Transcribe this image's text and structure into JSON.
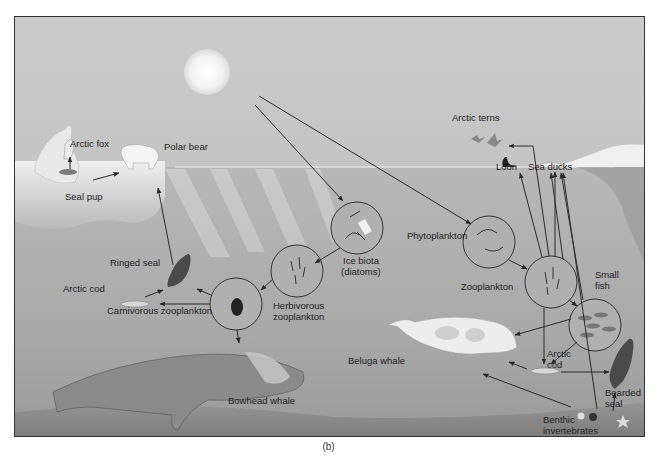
{
  "figure": {
    "caption": "(b)"
  },
  "labels": {
    "arctic_fox": "Arctic fox",
    "polar_bear": "Polar bear",
    "seal_pup": "Seal pup",
    "ringed_seal": "Ringed seal",
    "arctic_cod_left": "Arctic cod",
    "carnivorous_zooplankton": "Carnivorous zooplankton",
    "herbivorous_zooplankton_1": "Herbivorous",
    "herbivorous_zooplankton_2": "zooplankton",
    "ice_biota_1": "Ice biota",
    "ice_biota_2": "(diatoms)",
    "phytoplankton": "Phytoplankton",
    "zooplankton": "Zooplankton",
    "small_fish_1": "Small",
    "small_fish_2": "fish",
    "arctic_terns": "Arctic terns",
    "loon": "Loon",
    "sea_ducks": "Sea ducks",
    "beluga_whale": "Beluga whale",
    "arctic_cod_right_1": "Arctic",
    "arctic_cod_right_2": "cod",
    "bearded_seal_1": "Bearded",
    "bearded_seal_2": "seal",
    "benthic_1": "Benthic",
    "benthic_2": "invertebrates",
    "bowhead_whale": "Bowhead whale"
  },
  "food_web_links": [
    {
      "from": "Sun",
      "to": "Ice biota (diatoms)"
    },
    {
      "from": "Sun",
      "to": "Phytoplankton"
    },
    {
      "from": "Ice biota (diatoms)",
      "to": "Herbivorous zooplankton"
    },
    {
      "from": "Herbivorous zooplankton",
      "to": "Carnivorous zooplankton"
    },
    {
      "from": "Carnivorous zooplankton",
      "to": "Ringed seal"
    },
    {
      "from": "Carnivorous zooplankton",
      "to": "Arctic cod"
    },
    {
      "from": "Carnivorous zooplankton",
      "to": "Bowhead whale"
    },
    {
      "from": "Arctic cod",
      "to": "Ringed seal"
    },
    {
      "from": "Ringed seal",
      "to": "Polar bear"
    },
    {
      "from": "Seal pup",
      "to": "Arctic fox"
    },
    {
      "from": "Seal pup",
      "to": "Polar bear"
    },
    {
      "from": "Phytoplankton",
      "to": "Zooplankton"
    },
    {
      "from": "Zooplankton",
      "to": "Small fish"
    },
    {
      "from": "Zooplankton",
      "to": "Arctic cod"
    },
    {
      "from": "Zooplankton",
      "to": "Arctic terns"
    },
    {
      "from": "Zooplankton",
      "to": "Loon"
    },
    {
      "from": "Zooplankton",
      "to": "Sea ducks"
    },
    {
      "from": "Small fish",
      "to": "Sea ducks"
    },
    {
      "from": "Small fish",
      "to": "Beluga whale"
    },
    {
      "from": "Small fish",
      "to": "Arctic cod"
    },
    {
      "from": "Arctic cod",
      "to": "Beluga whale"
    },
    {
      "from": "Arctic cod",
      "to": "Bearded seal"
    },
    {
      "from": "Benthic invertebrates",
      "to": "Beluga whale"
    },
    {
      "from": "Benthic invertebrates",
      "to": "Bearded seal"
    },
    {
      "from": "Benthic invertebrates",
      "to": "Sea ducks"
    }
  ],
  "colors": {
    "sky": "#c9c9c9",
    "water": "#a8a8a8",
    "ice": "#e4e4e4",
    "seafloor": "#8a8a8a",
    "arrow": "#333333"
  }
}
